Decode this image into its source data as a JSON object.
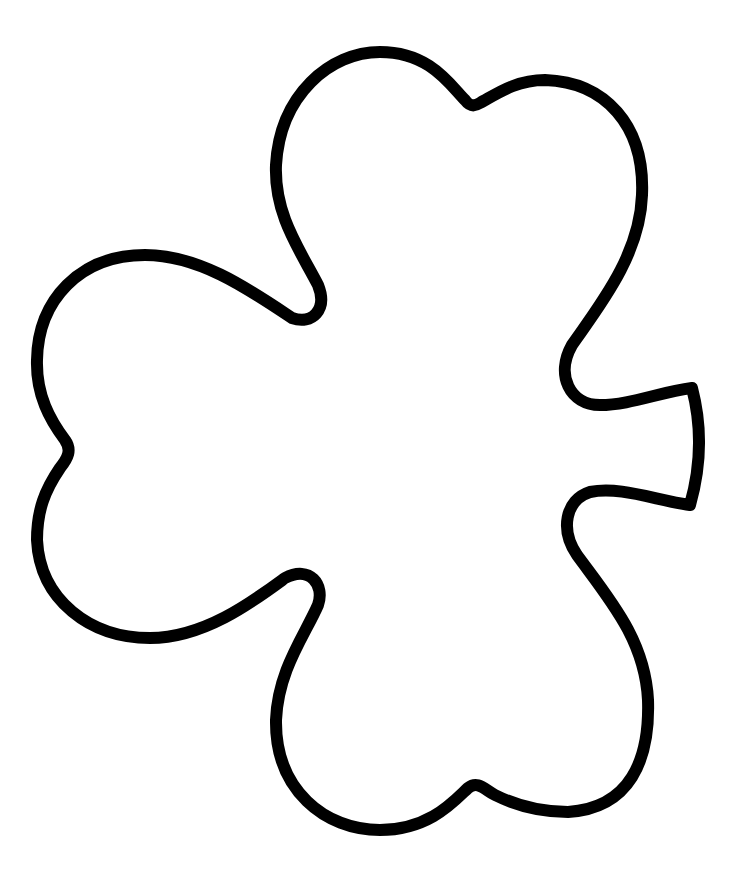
{
  "image": {
    "subject": "shamrock-outline",
    "stroke_color": "#000000",
    "fill_color": "#ffffff",
    "background": "#ffffff",
    "stroke_width": 12
  }
}
